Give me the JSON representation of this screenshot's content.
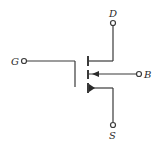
{
  "diagram": {
    "type": "n-channel enhancement MOSFET symbol",
    "line_color": "#3a3a3a",
    "terminals": {
      "gate": {
        "label": "G"
      },
      "drain": {
        "label": "D"
      },
      "source": {
        "label": "S"
      },
      "body": {
        "label": "B"
      }
    }
  }
}
